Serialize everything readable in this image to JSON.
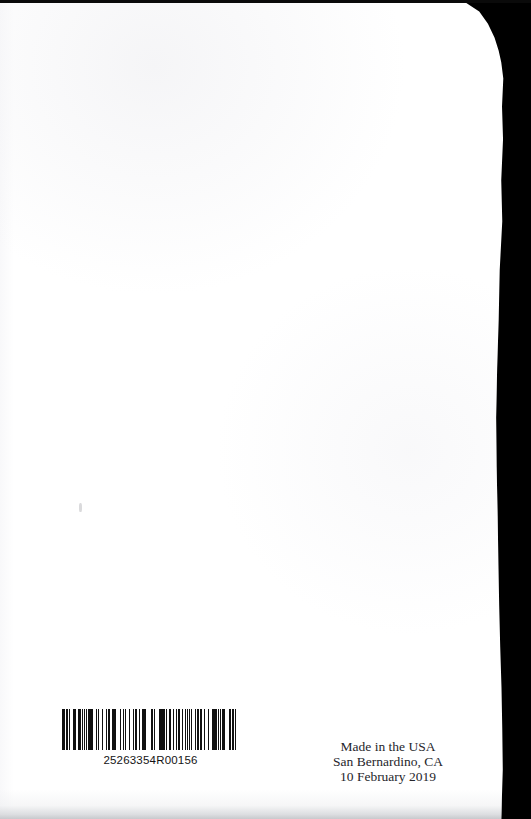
{
  "document": {
    "kind": "scanned-book-back-cover",
    "background_color": "#000000",
    "page_color": "#ffffff",
    "text_color": "#26262b"
  },
  "barcode": {
    "name": "print-on-demand-barcode",
    "number": "25263354R00156",
    "symbology_look": "code-128",
    "bar_color": "#111111",
    "bar_pattern": [
      3,
      1,
      1,
      2,
      3,
      1,
      2,
      1,
      1,
      3,
      1,
      1,
      2,
      2,
      1,
      1,
      3,
      1,
      1,
      2,
      1,
      2,
      2,
      1,
      1,
      3,
      2,
      1,
      1,
      1,
      3,
      2,
      1,
      1,
      2,
      1,
      2,
      3,
      1,
      1,
      1,
      2,
      1,
      3,
      2,
      1,
      1,
      1,
      2,
      2,
      3,
      1,
      1,
      1,
      1,
      3,
      1,
      2,
      2,
      1,
      1,
      2,
      1,
      1,
      3,
      2,
      1,
      1,
      2,
      1,
      1,
      3,
      1,
      2,
      1,
      1,
      2,
      3,
      1,
      1,
      1,
      2,
      2,
      1,
      3,
      1,
      1,
      2,
      1,
      3,
      1,
      1,
      2,
      1,
      2,
      2,
      1,
      3,
      1,
      1,
      1,
      1,
      2,
      1,
      3,
      1,
      2,
      1,
      1,
      2,
      3,
      1,
      1,
      1,
      2,
      3,
      1,
      2,
      1,
      1,
      1,
      3,
      2,
      1,
      1,
      2,
      1,
      1,
      3,
      1,
      1,
      2,
      2,
      1,
      1,
      3,
      1,
      2,
      1,
      1,
      2,
      1,
      3,
      1,
      1,
      2,
      1,
      3,
      1,
      1,
      2,
      2,
      1,
      1,
      3,
      1,
      1,
      1,
      2,
      3,
      1,
      1,
      2,
      1,
      2,
      1,
      3,
      1,
      1,
      2,
      1,
      1,
      3,
      2,
      1,
      1,
      1,
      2,
      2,
      3
    ]
  },
  "imprint": {
    "name": "printing-imprint",
    "lines": [
      "Made in the USA",
      "San Bernardino, CA",
      "10 February 2019"
    ],
    "line1": "Made in the USA",
    "line2": "San Bernardino, CA",
    "line3": "10 February 2019"
  }
}
